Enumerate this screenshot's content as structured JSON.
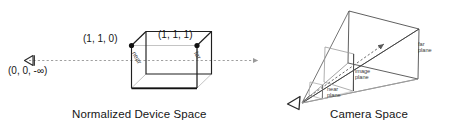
{
  "figure": {
    "background_color": "#ffffff",
    "line_color": "#222222",
    "light_line_color": "#b9b9b9",
    "dash_color": "#9a9a9a",
    "text_color": "#161616"
  },
  "panels": {
    "left": {
      "caption": "Normalized Device Space",
      "eye": {
        "icon": "eye-triangle-icon",
        "origin_label": "(0, 0, -∞)"
      },
      "box": {
        "corner_near_label": "(1, 1, 0)",
        "corner_far_label": "(1, 1, 1)",
        "near_face_label": "near",
        "far_face_label": "far"
      },
      "axis": {
        "style": "dashed",
        "arrow": "right-arrow-icon"
      }
    },
    "right": {
      "caption": "Camera Space",
      "eye": {
        "icon": "eye-triangle-icon"
      },
      "frustum": {
        "near_plane_label": "near\nplane",
        "near_plane_line1": "near",
        "near_plane_line2": "plane",
        "image_plane_line1": "image",
        "image_plane_line2": "plane",
        "far_plane_line1": "far",
        "far_plane_line2": "plane"
      },
      "view_ray": {
        "style": "dashed",
        "arrow": "up-right-arrow-icon"
      }
    }
  }
}
